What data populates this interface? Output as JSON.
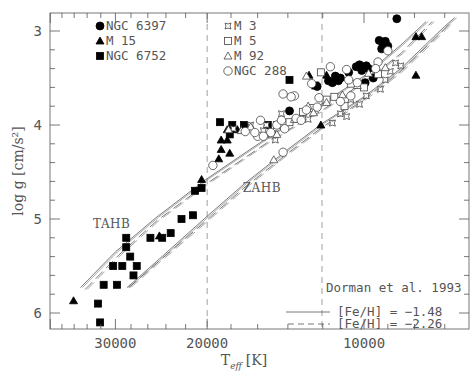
{
  "chart_data": {
    "type": "scatter",
    "title": "",
    "xlabel": "T_eff [K]",
    "xlabel_main": "T",
    "xlabel_sub": "eff",
    "xlabel_unit": "[K]",
    "ylabel": "log g [cm/s²]",
    "x_scale": "log",
    "x_reversed": true,
    "y_reversed": true,
    "xlim": [
      40100,
      6290
    ],
    "ylim": [
      2.8,
      6.2
    ],
    "x_ticks": [
      30000,
      20000,
      10000
    ],
    "x_tick_labels": [
      "30000",
      "20000",
      "10000"
    ],
    "y_ticks": [
      3,
      4,
      5,
      6
    ],
    "y_tick_labels": [
      "3",
      "4",
      "5",
      "6"
    ],
    "grid": false,
    "vertical_dashed_lines": [
      20000,
      12040
    ],
    "annotations": [
      {
        "text": "TAHB",
        "x": 30500,
        "y": 5.05
      },
      {
        "text": "ZAHB",
        "x": 15700,
        "y": 4.67
      }
    ],
    "legend_left": [
      {
        "label": "NGC 6397",
        "marker": "filled-circle"
      },
      {
        "label": "M 15",
        "marker": "filled-triangle"
      },
      {
        "label": "NGC 6752",
        "marker": "filled-square"
      }
    ],
    "legend_right": [
      {
        "label": "M 3",
        "marker": "open-star"
      },
      {
        "label": "M 5",
        "marker": "open-square"
      },
      {
        "label": "M 92",
        "marker": "open-triangle"
      },
      {
        "label": "NGC 288",
        "marker": "open-circle"
      }
    ],
    "model_legend": {
      "title": "Dorman et al. 1993",
      "entries": [
        {
          "label": "[Fe/H] = −1.48",
          "style": "solid"
        },
        {
          "label": "[Fe/H] = −2.26",
          "style": "dashed"
        }
      ]
    },
    "series": [
      {
        "name": "NGC 6397",
        "marker": "filled-circle",
        "points": [
          [
            8650,
            2.87
          ],
          [
            9350,
            3.1
          ],
          [
            9200,
            3.13
          ],
          [
            9000,
            3.16
          ],
          [
            9100,
            3.11
          ],
          [
            9250,
            3.19
          ],
          [
            9900,
            3.37
          ],
          [
            9800,
            3.4
          ],
          [
            10100,
            3.42
          ],
          [
            9600,
            3.5
          ],
          [
            10700,
            3.44
          ],
          [
            11100,
            3.5
          ],
          [
            11350,
            3.48
          ],
          [
            11500,
            3.55
          ],
          [
            11700,
            3.53
          ],
          [
            11200,
            3.53
          ],
          [
            10200,
            3.36
          ],
          [
            12300,
            3.59
          ],
          [
            10350,
            3.38
          ],
          [
            9950,
            3.55
          ],
          [
            13900,
            3.85
          ]
        ]
      },
      {
        "name": "M 15",
        "marker": "filled-triangle",
        "points": [
          [
            7950,
            3.06
          ],
          [
            7750,
            3.06
          ],
          [
            7950,
            3.47
          ],
          [
            12750,
            3.47
          ],
          [
            11800,
            3.47
          ],
          [
            12100,
            4.0
          ],
          [
            17500,
            4.05
          ],
          [
            18300,
            4.16
          ],
          [
            18800,
            4.16
          ],
          [
            18300,
            4.05
          ],
          [
            18800,
            4.26
          ],
          [
            18100,
            4.3
          ],
          [
            19000,
            4.36
          ],
          [
            20500,
            4.58
          ],
          [
            24700,
            5.18
          ],
          [
            36100,
            5.87
          ]
        ]
      },
      {
        "name": "NGC 6752",
        "marker": "filled-square",
        "points": [
          [
            17900,
            4.0
          ],
          [
            17000,
            4.0
          ],
          [
            18100,
            4.1
          ],
          [
            15300,
            4.0
          ],
          [
            13900,
            3.52
          ],
          [
            12400,
            3.58
          ],
          [
            20500,
            4.67
          ],
          [
            21100,
            4.7
          ],
          [
            21300,
            4.96
          ],
          [
            22400,
            5.0
          ],
          [
            23500,
            5.15
          ],
          [
            24400,
            5.2
          ],
          [
            25700,
            5.2
          ],
          [
            27300,
            5.5
          ],
          [
            27700,
            5.6
          ],
          [
            28100,
            5.4
          ],
          [
            28600,
            5.3
          ],
          [
            28600,
            5.2
          ],
          [
            30300,
            5.5
          ],
          [
            29800,
            5.7
          ],
          [
            31600,
            5.7
          ],
          [
            32400,
            5.9
          ],
          [
            32100,
            6.1
          ],
          [
            29100,
            5.5
          ],
          [
            18900,
            3.97
          ]
        ]
      },
      {
        "name": "M 3",
        "marker": "open-star",
        "points": [
          [
            16500,
            4.0
          ],
          [
            15400,
            4.0
          ],
          [
            14400,
            3.88
          ],
          [
            11500,
            3.98
          ],
          [
            11100,
            3.88
          ],
          [
            10800,
            3.91
          ],
          [
            9900,
            3.69
          ],
          [
            9300,
            3.62
          ],
          [
            9100,
            3.52
          ],
          [
            8900,
            3.43
          ],
          [
            8700,
            3.34
          ],
          [
            8500,
            3.37
          ],
          [
            9500,
            3.42
          ],
          [
            10200,
            3.78
          ],
          [
            10600,
            3.73
          ],
          [
            12800,
            3.94
          ],
          [
            13200,
            3.93
          ],
          [
            14800,
            4.16
          ],
          [
            15600,
            4.06
          ],
          [
            17800,
            4.04
          ]
        ]
      },
      {
        "name": "M 5",
        "marker": "open-square",
        "points": [
          [
            15000,
            4.1
          ],
          [
            14700,
            4.0
          ],
          [
            13100,
            3.86
          ],
          [
            12600,
            3.82
          ],
          [
            11800,
            3.73
          ],
          [
            10600,
            3.56
          ],
          [
            10000,
            3.6
          ],
          [
            9400,
            3.46
          ],
          [
            12100,
            3.44
          ],
          [
            11400,
            3.7
          ],
          [
            10900,
            3.8
          ],
          [
            13900,
            3.97
          ]
        ]
      },
      {
        "name": "M 92",
        "marker": "open-triangle",
        "points": [
          [
            14900,
            4.37
          ],
          [
            13600,
            3.94
          ],
          [
            12500,
            3.87
          ],
          [
            12900,
            3.48
          ],
          [
            11800,
            3.76
          ],
          [
            11000,
            3.68
          ],
          [
            10300,
            3.58
          ],
          [
            9800,
            3.45
          ],
          [
            9100,
            3.39
          ],
          [
            14700,
            4.1
          ],
          [
            16500,
            4.02
          ],
          [
            18200,
            4.05
          ],
          [
            12800,
            3.8
          ],
          [
            17200,
            4.06
          ]
        ]
      },
      {
        "name": "NGC 288",
        "marker": "open-circle",
        "points": [
          [
            19500,
            4.43
          ],
          [
            16000,
            4.12
          ],
          [
            15100,
            4.08
          ],
          [
            14200,
            4.04
          ],
          [
            14700,
            4.0
          ],
          [
            16900,
            4.07
          ],
          [
            13500,
            3.93
          ],
          [
            14300,
            4.29
          ],
          [
            13200,
            3.95
          ],
          [
            12300,
            3.81
          ],
          [
            12200,
            3.71
          ],
          [
            13600,
            3.69
          ],
          [
            13800,
            3.7
          ],
          [
            14300,
            3.67
          ],
          [
            12900,
            3.84
          ],
          [
            11100,
            3.75
          ],
          [
            10600,
            3.69
          ],
          [
            10300,
            3.55
          ],
          [
            10700,
            3.52
          ],
          [
            9400,
            3.33
          ],
          [
            9000,
            3.21
          ],
          [
            9500,
            3.4
          ],
          [
            10800,
            3.41
          ],
          [
            12600,
            3.56
          ],
          [
            11600,
            3.38
          ],
          [
            15800,
            3.95
          ],
          [
            16200,
            4.08
          ],
          [
            15600,
            4.12
          ],
          [
            14400,
            3.95
          ]
        ]
      }
    ],
    "model_curves": [
      {
        "name": "TAHB [Fe/H]=-1.48",
        "style": "solid",
        "points": [
          [
            35000,
            5.73
          ],
          [
            30000,
            5.35
          ],
          [
            25000,
            4.98
          ],
          [
            20000,
            4.57
          ],
          [
            15000,
            4.1
          ],
          [
            12000,
            3.77
          ],
          [
            10000,
            3.48
          ],
          [
            8500,
            3.15
          ],
          [
            7600,
            2.9
          ]
        ]
      },
      {
        "name": "TAHB [Fe/H]=-2.26",
        "style": "dashed",
        "points": [
          [
            34300,
            5.75
          ],
          [
            29500,
            5.38
          ],
          [
            25000,
            5.02
          ],
          [
            20000,
            4.62
          ],
          [
            15000,
            4.15
          ],
          [
            12000,
            3.84
          ],
          [
            10000,
            3.54
          ],
          [
            8500,
            3.24
          ],
          [
            7400,
            2.9
          ]
        ]
      },
      {
        "name": "ZAHB [Fe/H]=-1.48",
        "style": "solid",
        "points": [
          [
            28500,
            5.73
          ],
          [
            25000,
            5.45
          ],
          [
            20000,
            4.97
          ],
          [
            17000,
            4.63
          ],
          [
            14000,
            4.26
          ],
          [
            12000,
            3.98
          ],
          [
            10000,
            3.7
          ],
          [
            8500,
            3.4
          ],
          [
            7000,
            2.95
          ],
          [
            6700,
            2.86
          ]
        ]
      },
      {
        "name": "ZAHB [Fe/H]=-2.26",
        "style": "dashed",
        "points": [
          [
            28300,
            5.73
          ],
          [
            25000,
            5.47
          ],
          [
            20000,
            5.01
          ],
          [
            17000,
            4.67
          ],
          [
            14000,
            4.3
          ],
          [
            12000,
            4.02
          ],
          [
            10000,
            3.73
          ],
          [
            8500,
            3.43
          ],
          [
            7000,
            2.98
          ],
          [
            6800,
            2.9
          ]
        ]
      }
    ]
  }
}
